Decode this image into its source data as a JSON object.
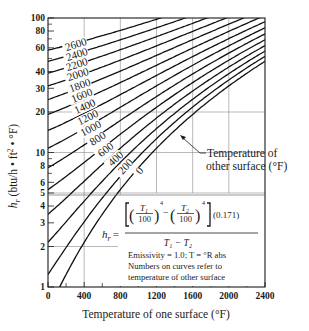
{
  "chart_data": {
    "type": "line",
    "title": "",
    "xlabel": "Temperature of one surface (°F)",
    "ylabel": "h_r (btu/h·ft²·°F)",
    "xscale": "linear",
    "yscale": "log",
    "xlim": [
      0,
      2400
    ],
    "ylim": [
      1,
      100
    ],
    "x_ticks": [
      0,
      400,
      800,
      1200,
      1600,
      2000,
      2400
    ],
    "x_minor_ticks": [
      200,
      600,
      1000,
      1400,
      1800,
      2200
    ],
    "y_ticks": [
      1,
      2,
      3,
      4,
      5,
      6,
      8,
      10,
      20,
      30,
      40,
      60,
      80,
      100
    ],
    "y_minor_ticks": [
      7,
      9,
      50,
      70,
      90
    ],
    "grid": {
      "vertical": [
        400,
        800,
        1200,
        1600,
        2000
      ],
      "horizontal": [
        2,
        5,
        10,
        20
      ]
    },
    "legend_annotation": "Temperature of other surface (°F)",
    "formula": {
      "lhs": "h_r =",
      "numerator": "[(T1/100)^4 − (T2/100)^4](0.171)",
      "denominator": "T1 − T2",
      "constant": "(0.171)"
    },
    "notes": [
      "Emissivity = 1.0; T = °R abs",
      "Numbers on curves refer to",
      "temperature of other surface"
    ],
    "x": [
      0,
      400,
      800,
      1200,
      1600,
      2000,
      2400
    ],
    "series": [
      {
        "name": "0",
        "values": [
          0.67,
          2.15,
          5.29,
          10.76,
          19.2,
          31.27,
          47.64
        ]
      },
      {
        "name": "200",
        "values": [
          1.24,
          3.05,
          6.64,
          12.66,
          21.76,
          34.61,
          51.86
        ]
      },
      {
        "name": "400",
        "values": [
          2.15,
          4.35,
          8.44,
          15.06,
          24.88,
          38.56,
          56.74
        ]
      },
      {
        "name": "600",
        "values": [
          3.47,
          6.12,
          10.76,
          18.04,
          28.64,
          43.19,
          62.36
        ]
      },
      {
        "name": "800",
        "values": [
          5.29,
          8.44,
          13.68,
          21.69,
          33.1,
          48.59,
          68.81
        ]
      },
      {
        "name": "1000",
        "values": [
          7.69,
          11.39,
          17.3,
          26.07,
          38.37,
          54.85,
          76.17
        ]
      },
      {
        "name": "1200",
        "values": [
          10.76,
          15.06,
          21.69,
          31.29,
          44.52,
          62.05,
          84.52
        ]
      },
      {
        "name": "1400",
        "values": [
          14.56,
          19.53,
          26.93,
          37.41,
          51.64,
          70.26,
          93.94
        ]
      },
      {
        "name": "1600",
        "values": [
          19.2,
          24.88,
          33.1,
          44.52,
          59.79,
          79.57,
          100
        ]
      },
      {
        "name": "1800",
        "values": [
          24.74,
          31.2,
          40.3,
          52.71,
          69.08,
          90.07,
          100
        ]
      },
      {
        "name": "2000",
        "values": [
          31.27,
          38.56,
          48.59,
          62.05,
          79.57,
          100,
          100
        ]
      },
      {
        "name": "2200",
        "values": [
          38.88,
          47.04,
          58.07,
          72.63,
          91.36,
          100,
          100
        ]
      },
      {
        "name": "2400",
        "values": [
          47.64,
          56.74,
          68.81,
          84.52,
          100,
          100,
          100
        ]
      },
      {
        "name": "2600",
        "values": [
          57.64,
          67.72,
          80.9,
          97.82,
          100,
          100,
          100
        ]
      }
    ]
  },
  "labels": {
    "xlabel": "Temperature of one surface (°F)",
    "ylabel_main": "h",
    "ylabel_sub": "r",
    "ylabel_rest": " (btu/h • ft",
    "ylabel_sup": "2",
    "ylabel_end": " • °F)",
    "annotation_line1": "Temperature of",
    "annotation_line2": "other surface (°F)",
    "formula_lhs": "h",
    "formula_lhs_sub": "r",
    "formula_eq": "=",
    "formula_const": "(0.171)",
    "formula_T": "T",
    "formula_100": "100",
    "formula_minus": "−",
    "formula_den": "T₁ − T₂",
    "note1": "Emissivity = 1.0; T = °R abs",
    "note2": "Numbers on curves refer to",
    "note3": "temperature of other surface"
  }
}
